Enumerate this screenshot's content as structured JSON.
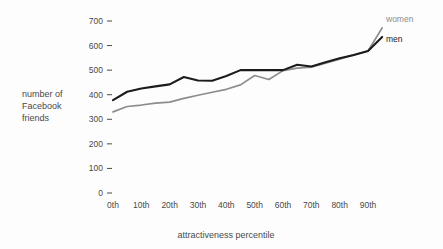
{
  "chart_data": {
    "type": "line",
    "title": "",
    "xlabel": "attractiveness percentile",
    "ylabel": "number of Facebook friends",
    "ylabel_lines": [
      "number of",
      "Facebook",
      "friends"
    ],
    "x": [
      0,
      5,
      10,
      15,
      20,
      25,
      30,
      35,
      40,
      45,
      50,
      55,
      60,
      65,
      70,
      75,
      80,
      85,
      90,
      95
    ],
    "xticks": [
      "0th",
      "10th",
      "20th",
      "30th",
      "40th",
      "50th",
      "60th",
      "70th",
      "80th",
      "90th"
    ],
    "xtick_values": [
      0,
      10,
      20,
      30,
      40,
      50,
      60,
      70,
      80,
      90
    ],
    "yticks": [
      0,
      100,
      200,
      300,
      400,
      500,
      600,
      700
    ],
    "ytick_labels": [
      "0",
      "100",
      "200",
      "300",
      "400",
      "500",
      "600",
      "700"
    ],
    "ylim": [
      0,
      720
    ],
    "xlim": [
      -3,
      99
    ],
    "grid": false,
    "legend_position": "right",
    "series": [
      {
        "name": "women",
        "color": "#8c8c8c",
        "values": [
          330,
          352,
          358,
          366,
          370,
          385,
          398,
          410,
          422,
          440,
          478,
          462,
          498,
          508,
          512,
          528,
          545,
          562,
          578,
          672
        ]
      },
      {
        "name": "men",
        "color": "#1c1c1c",
        "values": [
          378,
          412,
          425,
          434,
          442,
          472,
          458,
          457,
          476,
          500,
          500,
          500,
          500,
          522,
          515,
          532,
          548,
          562,
          578,
          635
        ]
      }
    ]
  },
  "legend": {
    "items": [
      {
        "label": "women",
        "color": "#8c8c8c"
      },
      {
        "label": "men",
        "color": "#1c1c1c"
      }
    ]
  }
}
